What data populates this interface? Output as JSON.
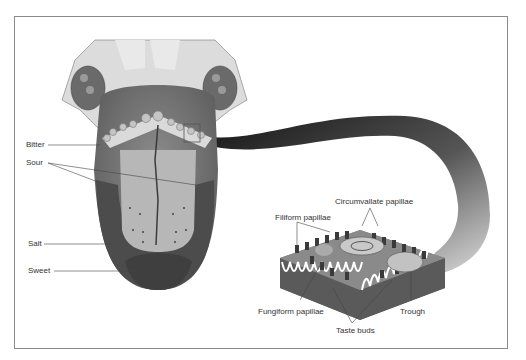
{
  "diagram": {
    "taste_regions": [
      {
        "label": "Bitter"
      },
      {
        "label": "Sour"
      },
      {
        "label": "Salt"
      },
      {
        "label": "Sweet"
      }
    ],
    "detail_labels": {
      "circumvallate": "Circumvallate papillae",
      "filiform": "Filiform papillae",
      "fungiform": "Fungiform papillae",
      "taste_buds": "Taste buds",
      "trough": "Trough"
    },
    "colors": {
      "frame": "#8a8a8a",
      "tongue_dark": "#4a4a4a",
      "tongue_mid": "#7a7a7a",
      "tongue_light": "#b9b9b9",
      "pale": "#d9d9d9",
      "ribbon_dark": "#111111",
      "ribbon_light": "#d0d0d0"
    }
  }
}
